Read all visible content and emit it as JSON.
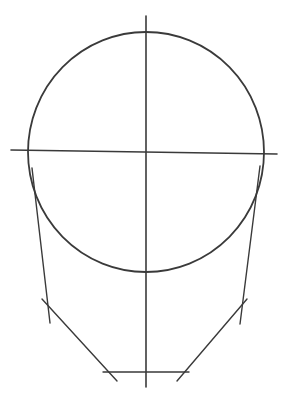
{
  "diagram": {
    "type": "face-construction-sketch",
    "background": "#ffffff",
    "stroke_color": "#3a3a3a",
    "elements": {
      "cranium_circle": {
        "cx": 146,
        "cy": 152,
        "rx": 118,
        "ry": 120,
        "width": 1.8
      },
      "vertical_center_line": {
        "x1": 146,
        "y1": 16,
        "x2": 146,
        "y2": 387,
        "width": 1.6
      },
      "horizontal_brow_line": {
        "x1": 11,
        "y1": 150,
        "x2": 277,
        "y2": 154,
        "width": 1.6
      },
      "left_side_line": {
        "x1": 32,
        "y1": 168,
        "x2": 50,
        "y2": 323,
        "width": 1.4
      },
      "right_side_line": {
        "x1": 260,
        "y1": 166,
        "x2": 240,
        "y2": 324,
        "width": 1.4
      },
      "left_jaw_line": {
        "x1": 42,
        "y1": 299,
        "x2": 117,
        "y2": 381,
        "width": 1.4
      },
      "right_jaw_line": {
        "x1": 247,
        "y1": 299,
        "x2": 177,
        "y2": 381,
        "width": 1.4
      },
      "chin_line": {
        "x1": 103,
        "y1": 372,
        "x2": 189,
        "y2": 372,
        "width": 1.4
      }
    }
  }
}
